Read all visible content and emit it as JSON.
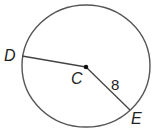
{
  "diagram": {
    "type": "circle-geometry",
    "circle": {
      "cx": 86,
      "cy": 66,
      "rx": 64,
      "ry": 61,
      "stroke": "#555555"
    },
    "center": {
      "label": "C",
      "x": 86,
      "y": 67
    },
    "points": [
      {
        "label": "D",
        "x": 22,
        "y": 56
      },
      {
        "label": "E",
        "x": 130,
        "y": 110
      }
    ],
    "segments": [
      {
        "from": "C",
        "to": "D",
        "label": ""
      },
      {
        "from": "C",
        "to": "E",
        "label": "8"
      }
    ],
    "labels": {
      "D": "D",
      "C": "C",
      "E": "E",
      "radius_length": "8"
    }
  }
}
